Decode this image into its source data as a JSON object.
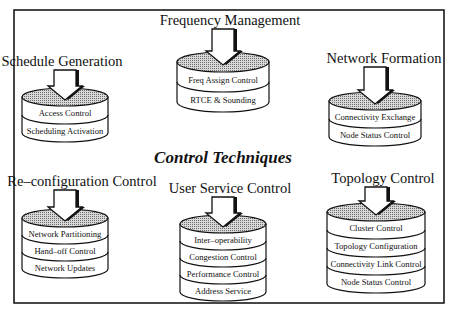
{
  "diagram": {
    "title": "Control Techniques",
    "frame": {
      "x": 14,
      "y": 10,
      "width": 430,
      "height": 293
    },
    "groups": [
      {
        "id": "schedule-generation",
        "title": "Schedule Generation",
        "title_pos": [
          62,
          66
        ],
        "cylinder": {
          "x": 22,
          "width": 86,
          "top_cy": 97,
          "ry": 9,
          "layer_h": 18
        },
        "layers": [
          "Access Control",
          "Scheduling Activation"
        ]
      },
      {
        "id": "frequency-management",
        "title": "Frequency Management",
        "title_pos": [
          230,
          25
        ],
        "cylinder": {
          "x": 177,
          "width": 92,
          "top_cy": 62,
          "ry": 10,
          "layer_h": 20
        },
        "layers": [
          "Freq Assign Control",
          "RTCE & Sounding"
        ]
      },
      {
        "id": "network-formation",
        "title": "Network Formation",
        "title_pos": [
          384,
          63
        ],
        "cylinder": {
          "x": 329,
          "width": 92,
          "top_cy": 101,
          "ry": 9,
          "layer_h": 18
        },
        "layers": [
          "Connectivity Exchange",
          "Node Status Control"
        ]
      },
      {
        "id": "reconfiguration-control",
        "title": "Re–configuration Control",
        "title_pos": [
          82,
          186
        ],
        "cylinder": {
          "x": 22,
          "width": 86,
          "top_cy": 218,
          "ry": 9,
          "layer_h": 17
        },
        "layers": [
          "Network Partitioning",
          "Hand–off Control",
          "Network Updates"
        ]
      },
      {
        "id": "user-service-control",
        "title": "User Service Control",
        "title_pos": [
          230,
          193
        ],
        "cylinder": {
          "x": 180,
          "width": 86,
          "top_cy": 224,
          "ry": 9,
          "layer_h": 17
        },
        "layers": [
          "Inter–operability",
          "Congestion Control",
          "Performance Control",
          "Address Service"
        ]
      },
      {
        "id": "topology-control",
        "title": "Topology Control",
        "title_pos": [
          383,
          183
        ],
        "cylinder": {
          "x": 327,
          "width": 98,
          "top_cy": 212,
          "ry": 9,
          "layer_h": 18
        },
        "layers": [
          "Cluster Control",
          "Topology Configuration",
          "Connectivity Link Control",
          "Node Status Control"
        ]
      }
    ]
  },
  "colors": {
    "ink": "#111111",
    "background": "#ffffff",
    "top_fill": "#bdbdbd"
  }
}
